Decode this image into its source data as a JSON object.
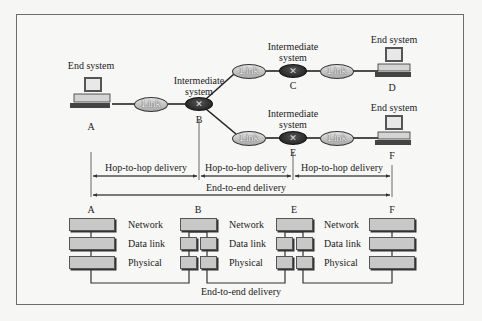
{
  "diagram": {
    "top_network": {
      "nodes": [
        {
          "id": "A",
          "type": "end-system",
          "caption": "End system",
          "letter": "A"
        },
        {
          "id": "B",
          "type": "intermediate-system",
          "caption_line1": "Intermediate",
          "caption_line2": "system",
          "letter": "B"
        },
        {
          "id": "C",
          "type": "intermediate-system",
          "caption_line1": "Intermediate",
          "caption_line2": "system",
          "letter": "C"
        },
        {
          "id": "D",
          "type": "end-system",
          "caption": "End system",
          "letter": "D"
        },
        {
          "id": "E",
          "type": "intermediate-system",
          "caption_line1": "Intermediate",
          "caption_line2": "system",
          "letter": "E"
        },
        {
          "id": "F",
          "type": "end-system",
          "caption": "End system",
          "letter": "F"
        }
      ],
      "links": [
        {
          "label": "Link",
          "from": "A",
          "to": "B"
        },
        {
          "label": "Link",
          "from": "B",
          "to": "C"
        },
        {
          "label": "Link",
          "from": "C",
          "to": "D"
        },
        {
          "label": "Link",
          "from": "B",
          "to": "E"
        },
        {
          "label": "Link",
          "from": "E",
          "to": "F"
        }
      ],
      "router_glyph": "✕"
    },
    "delivery": {
      "hops": [
        {
          "label": "Hop-to-hop delivery",
          "from": "A",
          "to": "B"
        },
        {
          "label": "Hop-to-hop delivery",
          "from": "B",
          "to": "E"
        },
        {
          "label": "Hop-to-hop delivery",
          "from": "E",
          "to": "F"
        }
      ],
      "end_to_end": {
        "label": "End-to-end delivery",
        "from": "A",
        "to": "F"
      }
    },
    "layer_stack": {
      "nodes": [
        "A",
        "B",
        "E",
        "F"
      ],
      "layer_labels": [
        "Network",
        "Data link",
        "Physical"
      ],
      "bottom_path_label": "End-to-end delivery"
    }
  }
}
